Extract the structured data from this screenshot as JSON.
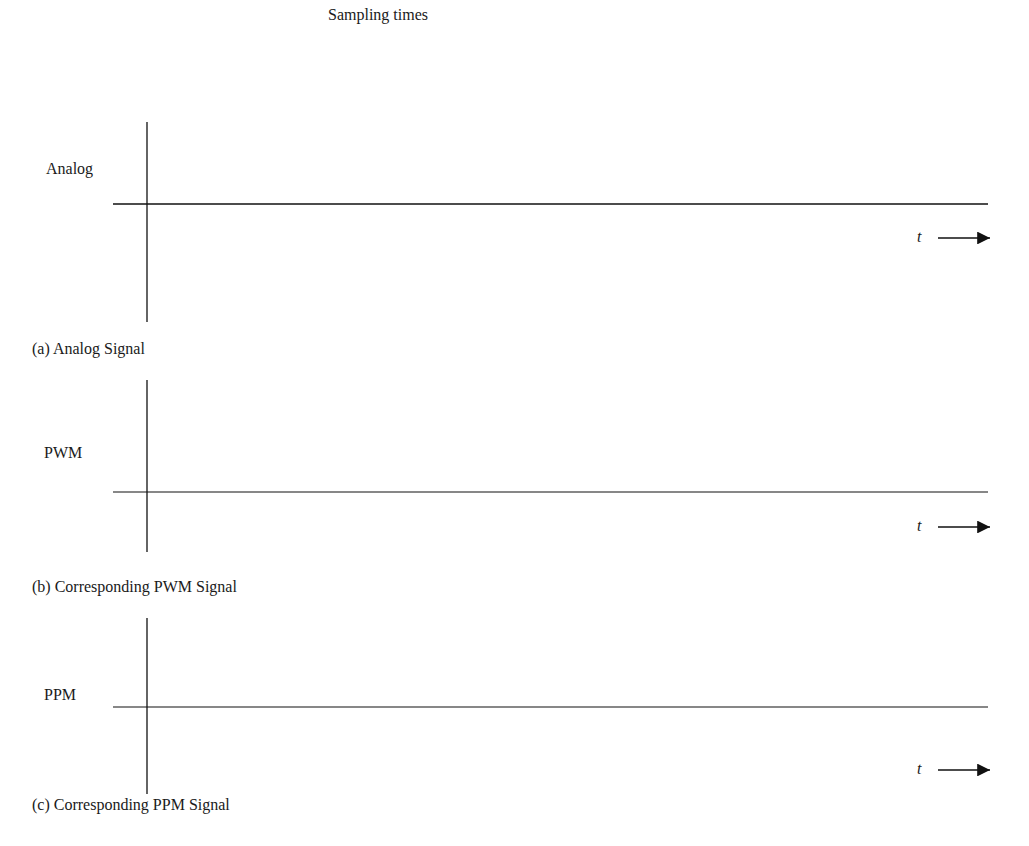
{
  "figure": {
    "header": "Sampling times",
    "panels": [
      {
        "id": "a",
        "signal_label": "Analog",
        "caption": "(a) Analog Signal",
        "time_label": "t"
      },
      {
        "id": "b",
        "signal_label": "PWM",
        "caption": "(b) Corresponding PWM Signal",
        "time_label": "t"
      },
      {
        "id": "c",
        "signal_label": "PPM",
        "caption": "(c) Corresponding PPM Signal",
        "time_label": "t"
      }
    ]
  },
  "chart_data": {
    "type": "diagram",
    "title": "Sampling times",
    "sampling_times_px": [
      147,
      232,
      312,
      393,
      475,
      560,
      641,
      724,
      805,
      887
    ],
    "analog": {
      "label": "Analog",
      "caption": "(a) Analog Signal",
      "baseline_y": 204,
      "path": "M147,149 C180,149 205,148 232,142 C265,134 285,130 312,130 C345,130 370,132 393,136 C425,142 450,148 475,155 C510,166 535,175 560,182 C590,190 620,197 641,203 C675,213 705,221 724,230 C760,246 785,262 805,266 C835,274 860,274 887,274 L935,274"
    },
    "pwm": {
      "label": "PWM",
      "caption": "(b) Corresponding PWM Signal",
      "high_y": 416,
      "low_y": 492,
      "pulses": [
        [
          147,
          210
        ],
        [
          232,
          296
        ],
        [
          312,
          385
        ],
        [
          393,
          464
        ],
        [
          475,
          541
        ],
        [
          560,
          610
        ],
        [
          641,
          683
        ],
        [
          724,
          753
        ],
        [
          805,
          817
        ]
      ],
      "line_start": 113,
      "line_end": 932
    },
    "ppm": {
      "label": "PPM",
      "caption": "(c) Corresponding PPM Signal",
      "high_y": 658,
      "low_y": 707,
      "pulse_width": 8,
      "pulses": [
        216,
        296,
        386,
        462,
        539,
        609,
        682,
        754,
        820,
        887
      ],
      "line_start": 113,
      "line_end": 944
    }
  }
}
